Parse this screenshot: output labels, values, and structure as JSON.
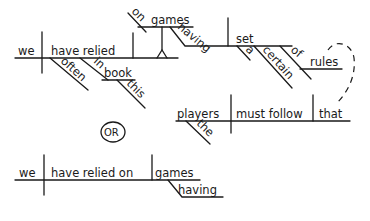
{
  "diagram": {
    "type": "sentence-diagram",
    "version_a": {
      "subject": "we",
      "verb": "have relied",
      "adverb_modifiers": [
        "often"
      ],
      "prepositional_phrase": {
        "preposition": "in",
        "object": "book",
        "modifiers": [
          "this"
        ]
      },
      "stilt_phrase": {
        "preposition": "on",
        "object": "games"
      },
      "gerund": "having",
      "gerund_object": "set",
      "gerund_object_modifiers": [
        "a",
        "certain"
      ],
      "of_phrase": {
        "preposition": "of",
        "object": "rules"
      },
      "relative_clause": {
        "subject": "players",
        "subject_modifier": "the",
        "verb": "must follow",
        "object": "that"
      }
    },
    "separator_label": "OR",
    "version_b": {
      "subject": "we",
      "verb": "have relied on",
      "object": "games",
      "participle": "having"
    }
  }
}
